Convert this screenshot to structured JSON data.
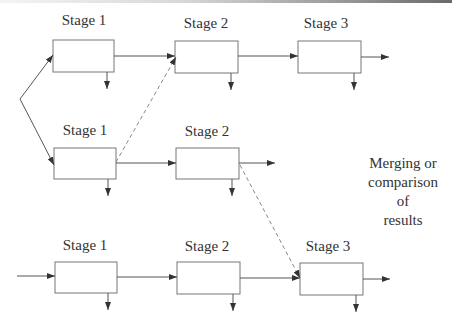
{
  "diagram": {
    "rows": [
      {
        "stages": [
          {
            "label": "Stage 1"
          },
          {
            "label": "Stage 2"
          },
          {
            "label": "Stage 3"
          }
        ]
      },
      {
        "stages": [
          {
            "label": "Stage 1"
          },
          {
            "label": "Stage 2"
          }
        ]
      },
      {
        "stages": [
          {
            "label": "Stage 1"
          },
          {
            "label": "Stage 2"
          },
          {
            "label": "Stage 3"
          }
        ]
      }
    ],
    "note": {
      "line1": "Merging or",
      "line2": "comparison of",
      "line3": "results"
    },
    "colors": {
      "stroke": "#555555",
      "dashed": "#888888",
      "text": "#333333"
    }
  }
}
